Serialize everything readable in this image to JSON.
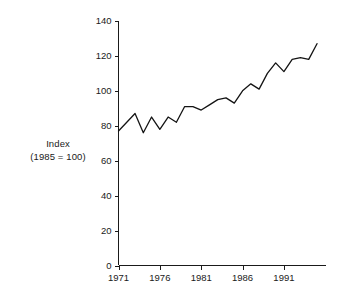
{
  "chart_data": {
    "type": "line",
    "title": "",
    "subtitle": "",
    "ylabel_line1": "Index",
    "ylabel_line2": "(1985 = 100)",
    "xlabel": "",
    "xlim": [
      1971,
      1995
    ],
    "ylim": [
      0,
      140
    ],
    "grid": false,
    "legend": null,
    "y_ticks": [
      0,
      20,
      40,
      60,
      80,
      100,
      120,
      140
    ],
    "y_tick_labels": [
      "0",
      "20",
      "40",
      "60",
      "80",
      "100",
      "120",
      "140"
    ],
    "x_ticks": [
      1971,
      1976,
      1981,
      1986,
      1991
    ],
    "x_tick_labels": [
      "1971",
      "1976",
      "1981",
      "1986",
      "1991"
    ],
    "series": [
      {
        "name": "Index (1985 = 100)",
        "x": [
          1971,
          1972,
          1973,
          1974,
          1975,
          1976,
          1977,
          1978,
          1979,
          1980,
          1981,
          1982,
          1983,
          1984,
          1985,
          1986,
          1987,
          1988,
          1989,
          1990,
          1991,
          1992,
          1993,
          1994,
          1995
        ],
        "values": [
          77,
          82,
          87,
          76,
          85,
          78,
          85,
          82,
          91,
          91,
          89,
          92,
          95,
          96,
          93,
          100,
          104,
          101,
          110,
          116,
          111,
          118,
          119,
          118,
          127
        ]
      }
    ]
  }
}
